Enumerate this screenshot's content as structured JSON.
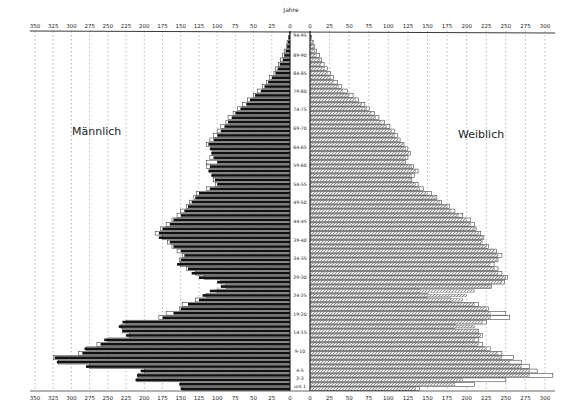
{
  "chart_data": {
    "type": "bar",
    "subtype": "population-pyramid",
    "title": "",
    "axis_label_center": "Jahre",
    "left_label": "Männlich",
    "right_label": "Weiblich",
    "xlabel": "",
    "ylabel": "Jahre",
    "x_ticks_left": [
      350,
      325,
      300,
      275,
      250,
      225,
      200,
      175,
      150,
      125,
      100,
      75,
      50,
      25,
      0
    ],
    "x_ticks_right": [
      0,
      25,
      50,
      75,
      100,
      125,
      150,
      175,
      200,
      225,
      250,
      275,
      300
    ],
    "xlim_left": [
      0,
      350
    ],
    "xlim_right": [
      0,
      310
    ],
    "grid": "vertical dashed",
    "age_labels": [
      "94-95",
      "89-90",
      "84-85",
      "79-80",
      "74-75",
      "69-70",
      "64-65",
      "59-60",
      "54-55",
      "49-50",
      "44-45",
      "39-40",
      "34-35",
      "29-30",
      "24-25",
      "19-20",
      "14-15",
      "9-10",
      "4-5",
      "2-3",
      "unt.1"
    ],
    "series": [
      {
        "name": "Männlich (filled)",
        "side": "left",
        "values": [
          1,
          2,
          3,
          4,
          6,
          8,
          10,
          14,
          17,
          20,
          25,
          30,
          35,
          40,
          48,
          55,
          60,
          68,
          75,
          80,
          85,
          90,
          95,
          100,
          105,
          112,
          110,
          108,
          105,
          100,
          110,
          112,
          108,
          103,
          100,
          110,
          125,
          130,
          135,
          140,
          145,
          150,
          160,
          165,
          175,
          180,
          180,
          165,
          160,
          150,
          145,
          150,
          155,
          140,
          135,
          125,
          100,
          95,
          110,
          120,
          125,
          140,
          150,
          160,
          175,
          230,
          235,
          230,
          225,
          255,
          260,
          282,
          285,
          323,
          320,
          280,
          205,
          210,
          212,
          152,
          150
        ]
      },
      {
        "name": "Männlich (outline)",
        "side": "left",
        "values": [
          1,
          2,
          4,
          5,
          8,
          10,
          13,
          16,
          20,
          22,
          28,
          32,
          38,
          45,
          50,
          58,
          65,
          72,
          78,
          85,
          88,
          95,
          100,
          105,
          110,
          115,
          108,
          106,
          110,
          115,
          115,
          110,
          106,
          105,
          102,
          115,
          128,
          132,
          138,
          142,
          150,
          155,
          162,
          170,
          178,
          185,
          175,
          168,
          162,
          155,
          148,
          152,
          150,
          142,
          130,
          118,
          95,
          88,
          100,
          115,
          130,
          148,
          152,
          170,
          180,
          225,
          232,
          230,
          220,
          250,
          265,
          280,
          290,
          325,
          318,
          275,
          200,
          208,
          210,
          150,
          148
        ]
      },
      {
        "name": "Weiblich (filled)",
        "side": "right",
        "values": [
          1,
          2,
          3,
          4,
          6,
          8,
          12,
          14,
          18,
          22,
          26,
          30,
          36,
          42,
          50,
          58,
          66,
          72,
          78,
          84,
          90,
          98,
          104,
          108,
          112,
          118,
          122,
          126,
          122,
          120,
          130,
          135,
          130,
          128,
          135,
          140,
          150,
          160,
          165,
          175,
          180,
          190,
          200,
          205,
          210,
          215,
          220,
          220,
          225,
          235,
          240,
          238,
          230,
          235,
          240,
          250,
          245,
          230,
          210,
          200,
          195,
          210,
          225,
          230,
          230,
          220,
          210,
          215,
          218,
          210,
          215,
          225,
          240,
          245,
          255,
          270,
          280,
          280,
          195,
          185,
          135
        ]
      },
      {
        "name": "Weiblich (outline)",
        "side": "right",
        "values": [
          1,
          2,
          4,
          6,
          8,
          12,
          15,
          18,
          22,
          26,
          30,
          35,
          40,
          48,
          55,
          62,
          70,
          76,
          82,
          88,
          95,
          102,
          108,
          112,
          115,
          120,
          125,
          128,
          125,
          122,
          132,
          138,
          133,
          130,
          138,
          145,
          155,
          162,
          168,
          178,
          185,
          195,
          205,
          210,
          212,
          218,
          222,
          218,
          228,
          238,
          245,
          240,
          235,
          240,
          245,
          252,
          248,
          232,
          140,
          150,
          180,
          215,
          228,
          250,
          255,
          225,
          185,
          215,
          220,
          215,
          220,
          230,
          245,
          260,
          270,
          280,
          290,
          310,
          250,
          210,
          140
        ]
      }
    ]
  }
}
